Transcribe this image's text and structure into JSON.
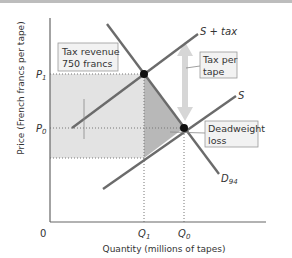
{
  "figure": {
    "y_axis_label": "Price (French francs per tape)",
    "x_axis_label": "Quantity (millions of tapes)",
    "origin_label": "0",
    "y_ticks": [
      {
        "label": "P",
        "sub": "1"
      },
      {
        "label": "P",
        "sub": "0"
      }
    ],
    "x_ticks": [
      {
        "label": "Q",
        "sub": "1"
      },
      {
        "label": "Q",
        "sub": "0"
      }
    ],
    "curves": {
      "supply_tax": {
        "label": "S + tax"
      },
      "supply": {
        "label": "S"
      },
      "demand": {
        "label": "D",
        "sub": "94"
      }
    },
    "callouts": {
      "tax_revenue": {
        "line1": "Tax revenue",
        "line2": "750 francs"
      },
      "tax_per_tape": {
        "line1": "Tax per",
        "line2": "tape"
      },
      "deadweight_loss": {
        "line1": "Deadweight",
        "line2": "loss"
      }
    },
    "colors": {
      "curve": "#6b6b6b",
      "tax_revenue_fill": "#e3e3e3",
      "deadweight_fill": "#b8b8b8",
      "arrow": "#d6d6d6",
      "axis": "#666666"
    }
  }
}
